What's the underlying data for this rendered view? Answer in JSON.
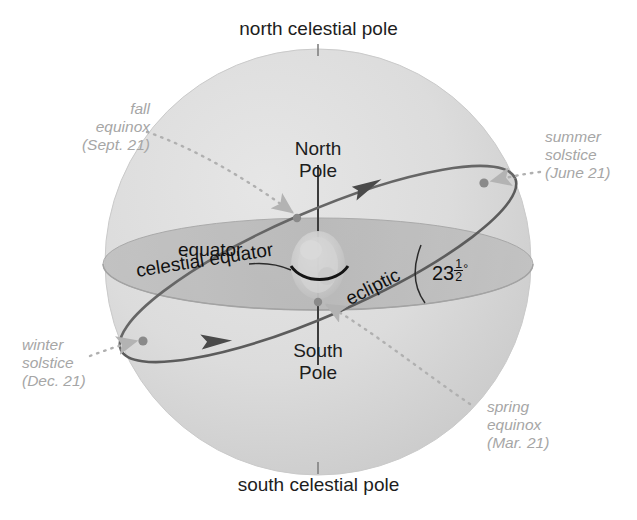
{
  "diagram": {
    "colors": {
      "background": "#ffffff",
      "sphere_fill": "#d9d9d9",
      "sphere_shade": "#cccccc",
      "equator_plane": "#b5b5b5",
      "ecliptic_line": "#5f5f5f",
      "label_gray": "#a6a6a6",
      "label_dark": "#1d1d1d",
      "earth": "#cfcfcf"
    }
  },
  "labels": {
    "north_celestial_pole": "north celestial pole",
    "south_celestial_pole": "south celestial pole",
    "north_pole": "North",
    "north_pole_2": "Pole",
    "south_pole": "South",
    "south_pole_2": "Pole",
    "equator": "equator",
    "celestial_equator": "celestial equator",
    "ecliptic": "ecliptic"
  },
  "angle": {
    "whole": "23",
    "numerator": "1",
    "denominator": "2",
    "degree": "°",
    "full_text": "23 1/2 degrees"
  },
  "seasonal_points": [
    {
      "id": "fall-equinox",
      "line1": "fall",
      "line2": "equinox",
      "line3": "(Sept. 21)"
    },
    {
      "id": "summer-solstice",
      "line1": "summer",
      "line2": "solstice",
      "line3": "(June 21)"
    },
    {
      "id": "winter-solstice",
      "line1": "winter",
      "line2": "solstice",
      "line3": "(Dec. 21)"
    },
    {
      "id": "spring-equinox",
      "line1": "spring",
      "line2": "equinox",
      "line3": "(Mar. 21)"
    }
  ]
}
